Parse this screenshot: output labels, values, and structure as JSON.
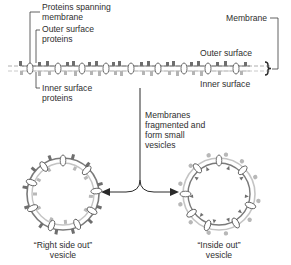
{
  "labels": {
    "proteins_spanning": [
      "Proteins spanning",
      "membrane"
    ],
    "outer_surface_proteins": [
      "Outer surface",
      "proteins"
    ],
    "inner_surface_proteins": [
      "Inner surface",
      "proteins"
    ],
    "membrane": "Membrane",
    "outer_surface": "Outer surface",
    "inner_surface": "Inner surface",
    "process": [
      "Membranes",
      "fragmented and",
      "form small",
      "vesicles"
    ],
    "right_side_out": [
      "“Right side out”",
      "vesicle"
    ],
    "inside_out": [
      "“Inside out”",
      "vesicle"
    ]
  },
  "colors": {
    "line": "#3a3a3a",
    "outer_protein": "#6e6e6e",
    "inner_protein": "#b4b4b4",
    "membrane_dash": "#9a9a9a"
  }
}
